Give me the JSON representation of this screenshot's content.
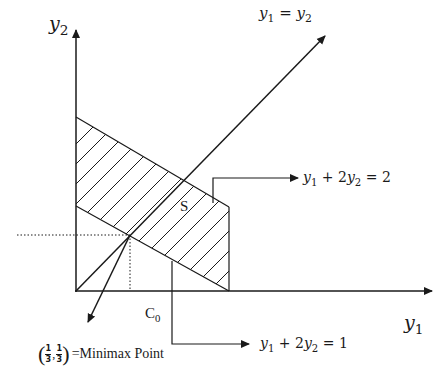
{
  "diagram": {
    "axes": {
      "x_label_var": "y",
      "x_label_sub": "1",
      "y_label_var": "y",
      "y_label_sub": "2"
    },
    "diagonal_label": {
      "lhs_var": "y",
      "lhs_sub": "1",
      "eq": "=",
      "rhs_var": "y",
      "rhs_sub": "2"
    },
    "upper_constraint": {
      "a_var": "y",
      "a_sub": "1",
      "plus": "+",
      "coef": "2",
      "b_var": "y",
      "b_sub": "2",
      "eq": "=",
      "rhs": "2"
    },
    "lower_constraint": {
      "a_var": "y",
      "a_sub": "1",
      "plus": "+",
      "coef": "2",
      "b_var": "y",
      "b_sub": "2",
      "eq": "=",
      "rhs": "1"
    },
    "region_label": "S",
    "c0_label": "C",
    "c0_sub": "0",
    "minimax": {
      "x_num": "1",
      "x_den": "3",
      "y_num": "1",
      "y_den": "3",
      "open": "(",
      "close": ")",
      "comma": ",",
      "suffix": "=Minimax Point"
    },
    "colors": {
      "line": "#1a1a1a",
      "background": "#ffffff"
    }
  }
}
